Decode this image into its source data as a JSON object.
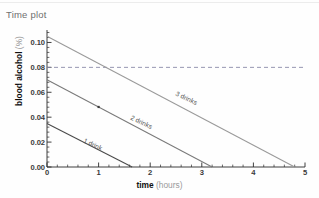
{
  "window": {
    "title": "Time plot"
  },
  "chart_data": {
    "type": "line",
    "title": "Time plot",
    "xlabel": "time",
    "xunit": "(hours)",
    "ylabel": "blood alcohol",
    "yunit": "(%)",
    "xlim": [
      0,
      5
    ],
    "ylim": [
      0,
      0.11
    ],
    "xticks": [
      "0",
      "1",
      "2",
      "3",
      "4",
      "5"
    ],
    "xtick_values": [
      0,
      1,
      2,
      3,
      4,
      5
    ],
    "yticks": [
      "0.00",
      "0.02",
      "0.04",
      "0.06",
      "0.08",
      "0.10"
    ],
    "ytick_values": [
      0.0,
      0.02,
      0.04,
      0.06,
      0.08,
      0.1
    ],
    "grid": false,
    "legend_position": "inline-labels",
    "series": [
      {
        "name": "1 drink",
        "label": "1 drink",
        "color": "#4a4a4a",
        "x": [
          0,
          1.65
        ],
        "y": [
          0.035,
          0.0
        ],
        "label_x": 0.72,
        "label_y": 0.0215,
        "label_angle": 25
      },
      {
        "name": "2 drinks",
        "label": "2 drinks",
        "color": "#7a7a7a",
        "x": [
          0,
          3.2
        ],
        "y": [
          0.07,
          0.0
        ],
        "label_x": 1.62,
        "label_y": 0.0405,
        "label_angle": 25
      },
      {
        "name": "3 drinks",
        "label": "3 drinks",
        "color": "#9a9a9a",
        "x": [
          0,
          4.8
        ],
        "y": [
          0.105,
          0.0
        ],
        "label_x": 2.5,
        "label_y": 0.0595,
        "label_angle": 25
      }
    ],
    "threshold_line": {
      "name": "legal-limit",
      "value": 0.08,
      "style": "dashed",
      "color": "#8a8aa8"
    },
    "markers": [
      {
        "series": "2 drinks",
        "x": 1.0,
        "y": 0.0482
      }
    ]
  }
}
